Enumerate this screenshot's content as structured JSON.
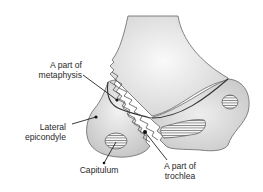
{
  "diagram": {
    "labels": {
      "metaphysis": {
        "line1": "A part of",
        "line2": "metaphysis"
      },
      "lateral_epicondyle": {
        "line1": "Lateral",
        "line2": "epicondyle"
      },
      "capitulum": {
        "text": "Capitulum"
      },
      "trochlea": {
        "line1": "A part of",
        "line2": "trochlea"
      }
    },
    "colors": {
      "bone_fill": "#e6e6e6",
      "bone_shade": "#c8c8c8",
      "outline": "#555555",
      "leader": "#222222",
      "hatch": "#444444"
    }
  }
}
